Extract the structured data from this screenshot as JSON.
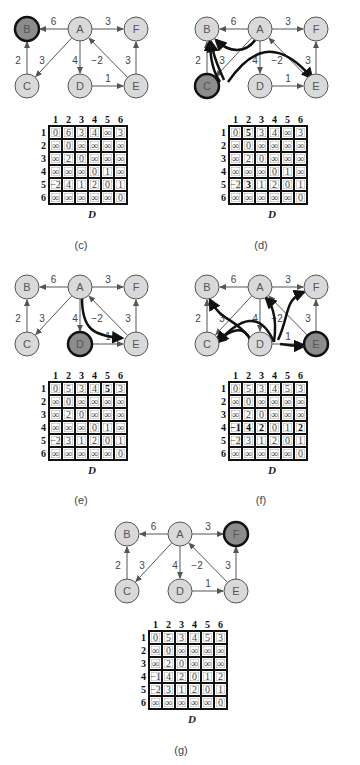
{
  "figure": {
    "column_headers": [
      "1",
      "2",
      "3",
      "4",
      "5",
      "6"
    ],
    "row_headers": [
      "1",
      "2",
      "3",
      "4",
      "5",
      "6"
    ],
    "matrix_label": "D",
    "nodes": {
      "A": {
        "label": "A",
        "dx": 80,
        "dy": 29
      },
      "B": {
        "label": "B",
        "dx": 27,
        "dy": 29
      },
      "F": {
        "label": "F",
        "dx": 136,
        "dy": 29
      },
      "C": {
        "label": "C",
        "dx": 27,
        "dy": 86
      },
      "D": {
        "label": "D",
        "dx": 80,
        "dy": 86
      },
      "E": {
        "label": "E",
        "dx": 136,
        "dy": 86
      }
    },
    "edges": [
      {
        "from": "A",
        "to": "B",
        "weight": "6"
      },
      {
        "from": "A",
        "to": "F",
        "weight": "3"
      },
      {
        "from": "C",
        "to": "B",
        "weight": "2"
      },
      {
        "from": "A",
        "to": "C",
        "weight": "3"
      },
      {
        "from": "A",
        "to": "D",
        "weight": "4"
      },
      {
        "from": "E",
        "to": "A",
        "weight": "−2"
      },
      {
        "from": "D",
        "to": "E",
        "weight": "1"
      },
      {
        "from": "E",
        "to": "F",
        "weight": "3"
      }
    ],
    "colors": {
      "node_fill": "#d9d9d9",
      "node_stroke": "#555555",
      "highlight_fill": "#8c8c8c",
      "highlight_stroke": "#111111",
      "edge": "#555555",
      "path": "#111111"
    }
  },
  "panels": [
    {
      "id": "c",
      "caption": "(c)",
      "highlighted_node": "B",
      "matrix": [
        [
          "0",
          "6",
          "3",
          "4",
          "∞",
          "3"
        ],
        [
          "∞",
          "0",
          "∞",
          "∞",
          "∞",
          "∞"
        ],
        [
          "∞",
          "2",
          "0",
          "∞",
          "∞",
          "∞"
        ],
        [
          "∞",
          "∞",
          "∞",
          "0",
          "1",
          "∞"
        ],
        [
          "−2",
          "4",
          "1",
          "2",
          "0",
          "1"
        ],
        [
          "∞",
          "∞",
          "∞",
          "∞",
          "∞",
          "0"
        ]
      ],
      "bold_cells": []
    },
    {
      "id": "d",
      "caption": "(d)",
      "highlighted_node": "C",
      "matrix": [
        [
          "0",
          "5",
          "3",
          "4",
          "∞",
          "3"
        ],
        [
          "∞",
          "0",
          "∞",
          "∞",
          "∞",
          "∞"
        ],
        [
          "∞",
          "2",
          "0",
          "∞",
          "∞",
          "∞"
        ],
        [
          "∞",
          "∞",
          "∞",
          "0",
          "1",
          "∞"
        ],
        [
          "−2",
          "3",
          "1",
          "2",
          "0",
          "1"
        ],
        [
          "∞",
          "∞",
          "∞",
          "∞",
          "∞",
          "0"
        ]
      ],
      "bold_cells": [
        [
          0,
          1
        ],
        [
          4,
          1
        ]
      ]
    },
    {
      "id": "e",
      "caption": "(e)",
      "highlighted_node": "D",
      "matrix": [
        [
          "0",
          "5",
          "3",
          "4",
          "5",
          "3"
        ],
        [
          "∞",
          "0",
          "∞",
          "∞",
          "∞",
          "∞"
        ],
        [
          "∞",
          "2",
          "0",
          "∞",
          "∞",
          "∞"
        ],
        [
          "∞",
          "∞",
          "∞",
          "0",
          "1",
          "∞"
        ],
        [
          "−2",
          "3",
          "1",
          "2",
          "0",
          "1"
        ],
        [
          "∞",
          "∞",
          "∞",
          "∞",
          "∞",
          "0"
        ]
      ],
      "bold_cells": [
        [
          0,
          4
        ]
      ]
    },
    {
      "id": "f",
      "caption": "(f)",
      "highlighted_node": "E",
      "matrix": [
        [
          "0",
          "5",
          "3",
          "4",
          "5",
          "3"
        ],
        [
          "∞",
          "0",
          "∞",
          "∞",
          "∞",
          "∞"
        ],
        [
          "∞",
          "2",
          "0",
          "∞",
          "∞",
          "∞"
        ],
        [
          "−1",
          "4",
          "2",
          "0",
          "1",
          "2"
        ],
        [
          "−2",
          "3",
          "1",
          "2",
          "0",
          "1"
        ],
        [
          "∞",
          "∞",
          "∞",
          "∞",
          "∞",
          "0"
        ]
      ],
      "bold_cells": [
        [
          3,
          0
        ],
        [
          3,
          1
        ],
        [
          3,
          2
        ],
        [
          3,
          5
        ]
      ]
    },
    {
      "id": "g",
      "caption": "(g)",
      "highlighted_node": "F",
      "matrix": [
        [
          "0",
          "5",
          "3",
          "4",
          "5",
          "3"
        ],
        [
          "∞",
          "0",
          "∞",
          "∞",
          "∞",
          "∞"
        ],
        [
          "∞",
          "2",
          "0",
          "∞",
          "∞",
          "∞"
        ],
        [
          "−1",
          "4",
          "2",
          "0",
          "1",
          "2"
        ],
        [
          "−2",
          "3",
          "1",
          "2",
          "0",
          "1"
        ],
        [
          "∞",
          "∞",
          "∞",
          "∞",
          "∞",
          "0"
        ]
      ],
      "bold_cells": []
    }
  ],
  "layout": [
    {
      "panel": "c",
      "x": 0,
      "y": 0,
      "mx": 36,
      "my": 114,
      "cap_y": 239
    },
    {
      "panel": "d",
      "x": 180,
      "y": 0,
      "mx": 216,
      "my": 114,
      "cap_y": 239
    },
    {
      "panel": "e",
      "x": 0,
      "y": 258,
      "mx": 36,
      "my": 370,
      "cap_y": 494
    },
    {
      "panel": "f",
      "x": 180,
      "y": 258,
      "mx": 216,
      "my": 370,
      "cap_y": 494
    },
    {
      "panel": "g",
      "x": 100,
      "y": 505,
      "mx": 136,
      "my": 619,
      "cap_y": 744
    }
  ]
}
